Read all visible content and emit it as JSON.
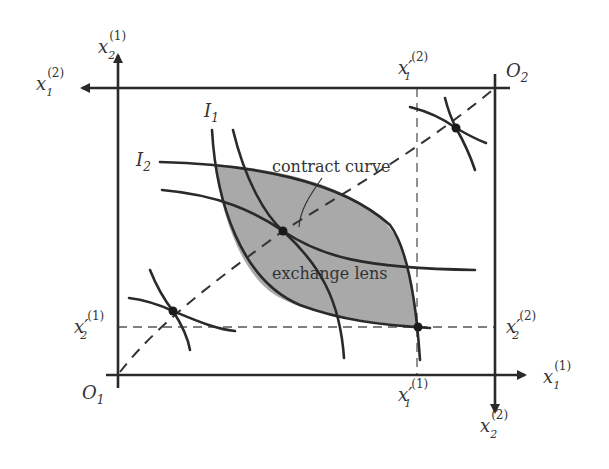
{
  "diagram": {
    "origins": {
      "o1": {
        "base": "O",
        "sub": "1"
      },
      "o2": {
        "base": "O",
        "sub": "2"
      }
    },
    "axes": {
      "x1_1": {
        "base": "x",
        "sub": "1",
        "sup": "(1)"
      },
      "x2_1": {
        "base": "x",
        "sub": "2",
        "sup": "(1)"
      },
      "x1_2": {
        "base": "x",
        "sub": "1",
        "sup": "(2)"
      },
      "x2_2": {
        "base": "x",
        "sub": "2",
        "sup": "(2)"
      }
    },
    "endowment_labels": {
      "x1p_1": {
        "base": "x′",
        "sub": "1",
        "sup": "(1)"
      },
      "x2p_1": {
        "base": "x′",
        "sub": "2",
        "sup": "(1)"
      },
      "x1p_2": {
        "base": "x′",
        "sub": "1",
        "sup": "(2)"
      },
      "x2p_2": {
        "base": "x′",
        "sub": "2",
        "sup": "(2)"
      }
    },
    "indifference_labels": {
      "i1": {
        "base": "I",
        "sub": "1"
      },
      "i2": {
        "base": "I",
        "sub": "2"
      }
    },
    "annotations": {
      "contract_curve": "contract curve",
      "exchange_lens": "exchange lens"
    },
    "colors": {
      "lens_fill": "#a9a9a9",
      "line": "#2a2a2a",
      "background": "#ffffff"
    }
  }
}
